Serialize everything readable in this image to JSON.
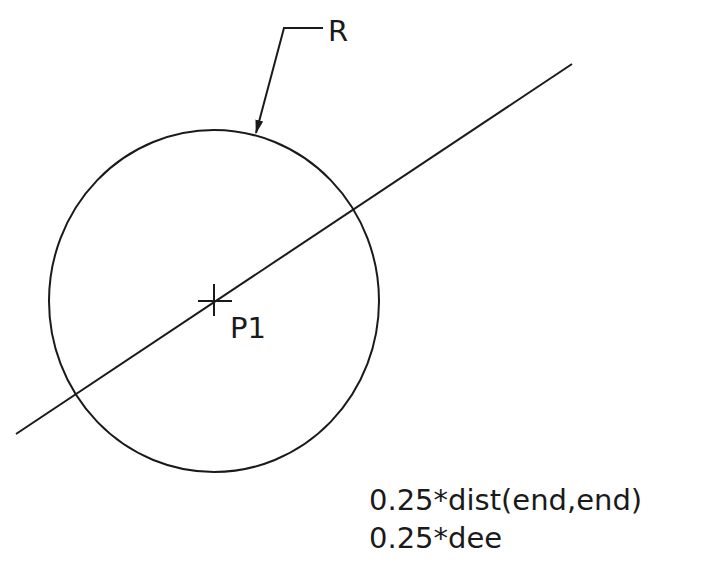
{
  "drawing": {
    "stroke_color": "#1a1a1a",
    "background_color": "#ffffff",
    "circle": {
      "label": "R",
      "center": [
        214,
        301
      ],
      "rx": 165,
      "ry": 171
    },
    "line": {
      "start": [
        16,
        434
      ],
      "end": [
        572,
        64
      ]
    },
    "point": {
      "label": "P1",
      "center": [
        214,
        301
      ]
    },
    "leader": {
      "label": "R",
      "points": [
        [
          323,
          28
        ],
        [
          284,
          28
        ],
        [
          256,
          133
        ]
      ]
    },
    "expressions": [
      "0.25*dist(end,end)",
      "0.25*dee"
    ]
  }
}
